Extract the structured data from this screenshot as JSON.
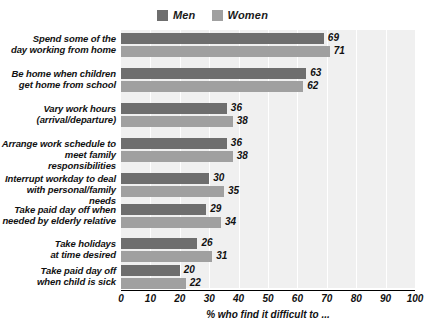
{
  "chart_data": {
    "type": "bar",
    "orientation": "horizontal",
    "title": "",
    "xlabel": "% who find it difficult to ...",
    "ylabel": "",
    "xlim": [
      0,
      100
    ],
    "xticks": [
      0,
      10,
      20,
      30,
      40,
      50,
      60,
      70,
      80,
      90,
      100
    ],
    "xtick_labels": [
      "0",
      "10",
      "20",
      "30",
      "40",
      "50",
      "60",
      "70",
      "80",
      "90",
      "100"
    ],
    "grid": "vertical",
    "legend_position": "top-center",
    "categories": [
      "Spend some of the day working from home",
      "Be home when children get home from school",
      "Vary work hours (arrival/departure)",
      "Arrange work schedule to meet family responsibilities",
      "Interrupt workday to deal with personal/family needs",
      "Take paid day off when needed by elderly relative",
      "Take holidays at time desired",
      "Take paid day off when child is sick"
    ],
    "category_lines": [
      [
        "Spend some of the",
        "day working from home"
      ],
      [
        "Be home when children",
        "get home from school"
      ],
      [
        "Vary work hours",
        "(arrival/departure)"
      ],
      [
        "Arrange work schedule to",
        "meet family responsibilities"
      ],
      [
        "Interrupt workday to deal",
        "with personal/family needs"
      ],
      [
        "Take paid day off when",
        "needed by elderly relative"
      ],
      [
        "Take holidays",
        "at time desired"
      ],
      [
        "Take paid day off",
        "when child is sick"
      ]
    ],
    "series": [
      {
        "name": "Men",
        "color": "#6e6e6e",
        "values": [
          69,
          63,
          36,
          36,
          30,
          29,
          26,
          20
        ]
      },
      {
        "name": "Women",
        "color": "#a0a0a0",
        "values": [
          71,
          62,
          38,
          38,
          35,
          34,
          31,
          22
        ]
      }
    ]
  },
  "legend": {
    "entries": [
      {
        "label": "Men",
        "color": "#6e6e6e"
      },
      {
        "label": "Women",
        "color": "#a0a0a0"
      }
    ]
  },
  "axis": {
    "title": "% who find it difficult to ...",
    "tick_labels": [
      "0",
      "10",
      "20",
      "30",
      "40",
      "50",
      "60",
      "70",
      "80",
      "90",
      "100"
    ]
  },
  "colors": {
    "plot_background": "#f0f0f0",
    "gridline": "#ffffff",
    "axis": "#000000",
    "text": "#111111",
    "men": "#6e6e6e",
    "women": "#a0a0a0"
  }
}
